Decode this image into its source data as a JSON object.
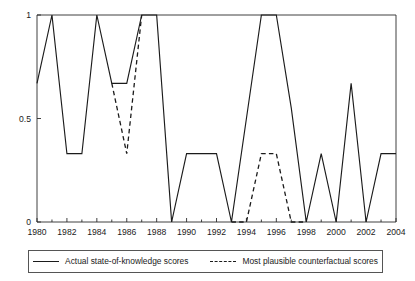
{
  "chart_data": {
    "type": "line",
    "title": "",
    "subtitle": "",
    "xlabel": "",
    "ylabel": "",
    "xlim": [
      1980,
      2004
    ],
    "ylim": [
      0,
      1
    ],
    "grid": false,
    "legend_position": "bottom",
    "x": [
      1980,
      1981,
      1982,
      1983,
      1984,
      1985,
      1986,
      1987,
      1988,
      1989,
      1990,
      1991,
      1992,
      1993,
      1994,
      1995,
      1996,
      1997,
      1998,
      1999,
      2000,
      2001,
      2002,
      2003,
      2004
    ],
    "y_ticks": [
      0,
      0.5,
      1
    ],
    "y_tick_labels": [
      "0",
      "0.5",
      "1"
    ],
    "x_ticks": [
      1980,
      1982,
      1984,
      1986,
      1988,
      1990,
      1992,
      1994,
      1996,
      1998,
      2000,
      2002,
      2004
    ],
    "x_tick_labels": [
      "1980",
      "1982",
      "1984",
      "1986",
      "1988",
      "1990",
      "1992",
      "1994",
      "1996",
      "1998",
      "2000",
      "2002",
      "2004"
    ],
    "x_minor_ticks": [
      1981,
      1983,
      1985,
      1987,
      1989,
      1991,
      1993,
      1995,
      1997,
      1999,
      2001,
      2003
    ],
    "series": [
      {
        "name": "Actual state-of-knowledge scores",
        "style": "solid",
        "color": "#1b1b1b",
        "x": [
          1980,
          1981,
          1982,
          1983,
          1984,
          1985,
          1986,
          1987,
          1988,
          1989,
          1990,
          1991,
          1992,
          1993,
          1994,
          1995,
          1996,
          1997,
          1998,
          1999,
          2000,
          2001,
          2002,
          2003,
          2004
        ],
        "values": [
          0.67,
          1,
          0.33,
          0.33,
          1,
          0.67,
          0.67,
          1,
          1,
          0,
          0.33,
          0.33,
          0.33,
          0,
          0.5,
          1,
          1,
          0.55,
          0,
          0.33,
          0,
          0.67,
          0,
          0.33,
          0.33
        ]
      },
      {
        "name": "Most plausible counterfactual scores",
        "style": "dashed",
        "color": "#1b1b1b",
        "segments": [
          {
            "x": [
              1985,
              1986,
              1987
            ],
            "values": [
              0.67,
              0.33,
              1
            ]
          },
          {
            "x": [
              1993,
              1994,
              1995,
              1996,
              1997,
              1998
            ],
            "values": [
              0,
              0,
              0.33,
              0.33,
              0,
              0
            ]
          }
        ]
      }
    ]
  },
  "legend": {
    "entries": [
      {
        "label": "Actual state-of-knowledge scores",
        "style": "solid"
      },
      {
        "label": "Most plausible counterfactual scores",
        "style": "dashed"
      }
    ]
  }
}
